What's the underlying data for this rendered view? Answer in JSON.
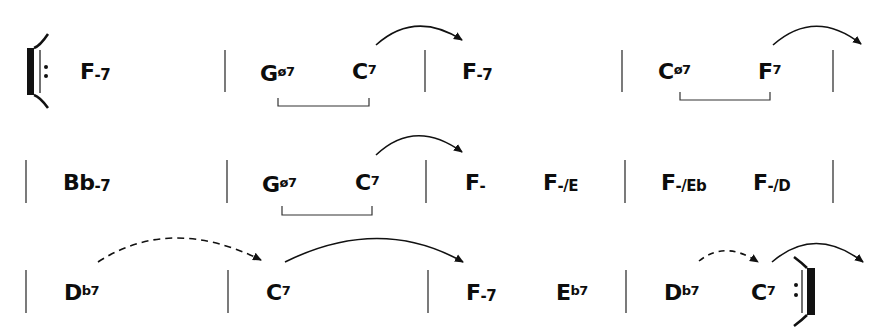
{
  "chart": {
    "key_context": "F minor blues-style progression",
    "rows": [
      {
        "y": 72,
        "start": "repeat-open",
        "end": "barline",
        "measures": [
          {
            "chords": [
              {
                "root": "F",
                "quality": "-7",
                "x": 78
              }
            ]
          },
          {
            "chords": [
              {
                "root": "G",
                "quality": "ø7",
                "x": 258
              },
              {
                "root": "C",
                "quality": "7",
                "x": 352
              }
            ],
            "bracket": true
          },
          {
            "chords": [
              {
                "root": "F",
                "quality": "-7",
                "x": 461
              }
            ]
          },
          {
            "chords": [
              {
                "root": "C",
                "quality": "ø7",
                "x": 658
              },
              {
                "root": "F",
                "quality": "7",
                "x": 757
              }
            ],
            "bracket": true
          }
        ]
      },
      {
        "y": 183,
        "start": "barline",
        "end": "barline",
        "measures": [
          {
            "chords": [
              {
                "root": "Bb",
                "quality": "-7",
                "x": 63
              }
            ]
          },
          {
            "chords": [
              {
                "root": "G",
                "quality": "ø7",
                "x": 261
              },
              {
                "root": "C",
                "quality": "7",
                "x": 355
              }
            ],
            "bracket": true
          },
          {
            "chords": [
              {
                "root": "F",
                "quality": "-",
                "x": 464
              },
              {
                "root": "F",
                "quality": "-/E",
                "x": 542
              }
            ]
          },
          {
            "chords": [
              {
                "root": "F",
                "quality": "-/Eb",
                "x": 660
              },
              {
                "root": "F",
                "quality": "-/D",
                "x": 752
              }
            ]
          }
        ]
      },
      {
        "y": 293,
        "start": "barline",
        "end": "repeat-close",
        "measures": [
          {
            "chords": [
              {
                "root": "D",
                "quality": "b7",
                "x": 63
              }
            ]
          },
          {
            "chords": [
              {
                "root": "C",
                "quality": "7",
                "x": 265
              }
            ]
          },
          {
            "chords": [
              {
                "root": "F",
                "quality": "-7",
                "x": 465
              },
              {
                "root": "E",
                "quality": "b7",
                "x": 555
              }
            ]
          },
          {
            "chords": [
              {
                "root": "D",
                "quality": "b7",
                "x": 663
              },
              {
                "root": "C",
                "quality": "7",
                "x": 750
              }
            ]
          }
        ]
      }
    ],
    "arrows": [
      {
        "from": [
          376,
          45
        ],
        "to": [
          462,
          40
        ],
        "style": "solid",
        "row": 0
      },
      {
        "from": [
          773,
          43
        ],
        "to": [
          860,
          42
        ],
        "style": "solid",
        "row": 0
      },
      {
        "from": [
          376,
          153
        ],
        "to": [
          462,
          152
        ],
        "style": "solid",
        "row": 1
      },
      {
        "from": [
          98,
          262
        ],
        "to": [
          261,
          261
        ],
        "style": "dashed",
        "row": 2
      },
      {
        "from": [
          285,
          261
        ],
        "to": [
          463,
          262
        ],
        "style": "solid",
        "row": 2
      },
      {
        "from": [
          699,
          261
        ],
        "to": [
          758,
          262
        ],
        "style": "dashed",
        "row": 2
      },
      {
        "from": [
          772,
          262
        ],
        "to": [
          863,
          262
        ],
        "style": "solid",
        "row": 2
      }
    ],
    "brackets": [
      {
        "x1": 278,
        "x2": 369,
        "y": 105
      },
      {
        "x1": 680,
        "x2": 770,
        "y": 99
      },
      {
        "x1": 282,
        "x2": 372,
        "y": 215
      }
    ],
    "barlines_x": [
      [
        225,
        425,
        622,
        833
      ],
      [
        26,
        227,
        426,
        625,
        833
      ],
      [
        26,
        228,
        428,
        626
      ]
    ]
  }
}
